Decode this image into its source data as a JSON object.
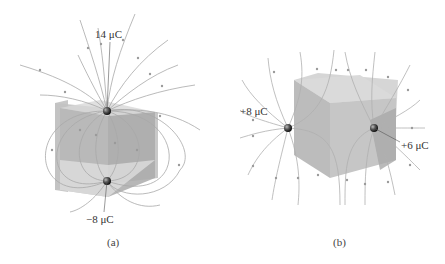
{
  "panels": [
    {
      "id": "a",
      "caption": "(a)",
      "charges": [
        {
          "label": "14 μC",
          "sign": "positive",
          "value_uC": 14
        },
        {
          "label": "−8 μC",
          "sign": "negative",
          "value_uC": -8
        }
      ]
    },
    {
      "id": "b",
      "caption": "(b)",
      "charges": [
        {
          "label": "+8 μC",
          "sign": "positive",
          "value_uC": 8
        },
        {
          "label": "+6 μC",
          "sign": "positive",
          "value_uC": 6
        }
      ]
    }
  ],
  "colors": {
    "field_line": "#a8a8a8",
    "cube_face_dark": "#b4b4b4",
    "cube_face_light": "#d6d6d6",
    "charge": "#2a2a2a"
  }
}
